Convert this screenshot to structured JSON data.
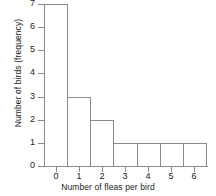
{
  "chart_data": {
    "type": "bar",
    "title": "",
    "xlabel": "Number of fleas per bird",
    "ylabel": "Number of birds (frequency)",
    "categories": [
      "0",
      "1",
      "2",
      "3",
      "4",
      "5",
      "6"
    ],
    "values": [
      7,
      3,
      2,
      1,
      1,
      1,
      1
    ],
    "xtick_labels": [
      "0",
      "1",
      "2",
      "3",
      "4",
      "5",
      "6"
    ],
    "ytick_labels": [
      "0",
      "1",
      "2",
      "3",
      "4",
      "5",
      "6",
      "7"
    ],
    "ylim": [
      0,
      7
    ],
    "xlim": [
      -0.5,
      6.5
    ],
    "grid": false,
    "legend": false,
    "bar_fill": "#ffffff",
    "bar_stroke": "#8a8a8a",
    "axis_color": "#8a8a8a",
    "text_color": "#1a1a1a"
  }
}
